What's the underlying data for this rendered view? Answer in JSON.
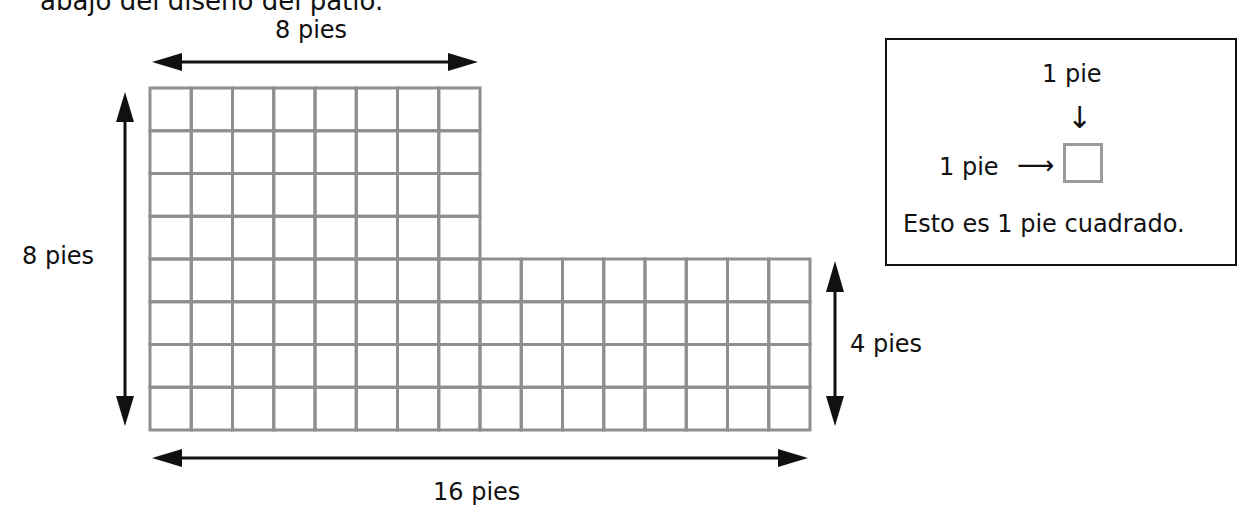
{
  "intro_text_partial": "abajo del diseño del patio.",
  "diagram": {
    "grid_color": "#8f8f8f",
    "arrow_color": "#111111",
    "upper_section": {
      "columns": 8,
      "rows": 4
    },
    "lower_section": {
      "columns": 16,
      "rows": 4
    },
    "labels": {
      "top_width": "8 pies",
      "left_height": "8 pies",
      "right_height": "4 pies",
      "bottom_width": "16 pies"
    }
  },
  "legend": {
    "top_label": "1 pie",
    "side_label": "1 pie",
    "down_arrow": "↓",
    "right_arrow": "⟶",
    "caption": "Esto es 1 pie cuadrado."
  }
}
